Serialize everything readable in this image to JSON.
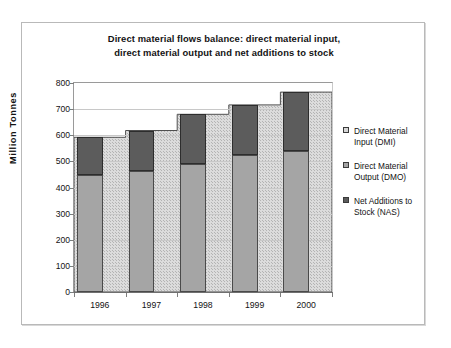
{
  "chart_data": {
    "type": "bar",
    "title": "Direct material flows balance: direct material input, direct material output and net additions to stock",
    "title_lines": [
      "Direct material flows balance: direct material input,",
      "direct material output and net additions to stock"
    ],
    "xlabel": "",
    "ylabel": "Million Tonnes",
    "categories": [
      "1996",
      "1997",
      "1998",
      "1999",
      "2000"
    ],
    "ylim": [
      0,
      800
    ],
    "yticks": [
      800,
      700,
      600,
      500,
      400,
      300,
      200,
      100,
      0
    ],
    "grid": true,
    "legend_position": "right",
    "stacked": true,
    "series": [
      {
        "name": "Direct Material Input (DMI)",
        "short": "DMI",
        "render": "area",
        "color": "#d6d6d6",
        "values": [
          592,
          618,
          680,
          716,
          765
        ]
      },
      {
        "name": "Direct Material Output (DMO)",
        "short": "DMO",
        "render": "bar-segment",
        "color": "#a5a5a5",
        "values": [
          447,
          465,
          490,
          525,
          540
        ]
      },
      {
        "name": "Net Additions to Stock (NAS)",
        "short": "NAS",
        "render": "bar-segment",
        "color": "#5c5c5c",
        "values": [
          145,
          152,
          190,
          191,
          225
        ]
      }
    ]
  },
  "legend": {
    "items": [
      {
        "line1": "Direct Material",
        "line2": "Input (DMI)",
        "swatch": "dmi"
      },
      {
        "line1": "Direct Material",
        "line2": "Output (DMO)",
        "swatch": "dmo"
      },
      {
        "line1": "Net Additions to",
        "line2": "Stock (NAS)",
        "swatch": "nas"
      }
    ]
  },
  "axis": {
    "y_title": "Million Tonnes"
  }
}
